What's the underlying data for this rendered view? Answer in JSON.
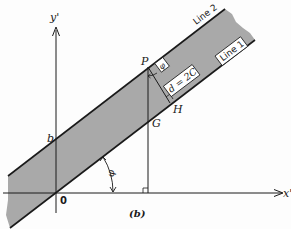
{
  "figure": {
    "caption": "(b)",
    "axes": {
      "x_label": "x'",
      "y_label": "y'",
      "origin_label": "0"
    },
    "lines": [
      {
        "name": "Line 1",
        "label": "Line 1"
      },
      {
        "name": "Line 2",
        "label": "Line 2"
      }
    ],
    "points": {
      "P": "P",
      "G": "G",
      "H": "H",
      "b": "b"
    },
    "annotations": {
      "distance": "d = 2C",
      "angle_symbol": "φ",
      "angle_symbol_small": "φ"
    },
    "colors": {
      "band_fill": "#a9a9a9",
      "line": "#1a1a1a",
      "background": "#fdfdfd"
    }
  }
}
